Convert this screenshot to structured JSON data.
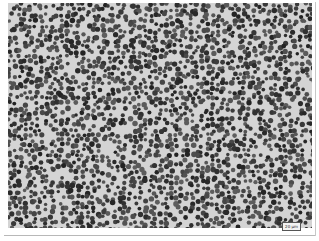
{
  "image": {
    "subject": "histology micrograph of densely packed lymphoid cells",
    "stain": "grayscale",
    "background_color": "#d4d4d4",
    "nucleus_color": "#3a3a3a",
    "frame_color": "#ffffff"
  },
  "scale_bar": {
    "label": "20 µm"
  }
}
